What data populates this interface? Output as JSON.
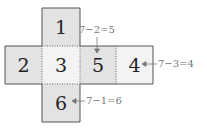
{
  "faces": {
    "top": "1",
    "left": "2",
    "center": "3",
    "right_center": "5",
    "far_right": "4",
    "bottom": "6"
  },
  "annotations": {
    "top_label": "7−2=5",
    "right_label": "7−3=4",
    "bottom_label": "7−1=6"
  },
  "colors": {
    "dark_face": "#e3e3e3",
    "light_face": "#f3f3f3",
    "border": "#555555",
    "annotation": "#777777"
  }
}
